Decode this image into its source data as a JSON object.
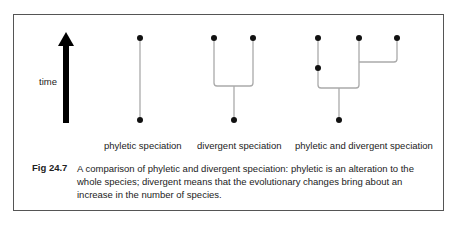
{
  "diagram": {
    "axis_label": "time",
    "panels": [
      {
        "id": "phyletic",
        "label": "phyletic speciation"
      },
      {
        "id": "divergent",
        "label": "divergent speciation"
      },
      {
        "id": "both",
        "label": "phyletic and divergent speciation"
      }
    ],
    "colors": {
      "line": "#aaaaaa",
      "node": "#111111",
      "arrow": "#000000",
      "border": "#555555"
    }
  },
  "caption": {
    "figure_number": "Fig 24.7",
    "text": "A comparison of phyletic and divergent speciation: phyletic is an alteration to the whole species; divergent means that the evolutionary changes bring about an increase in the number of species."
  }
}
